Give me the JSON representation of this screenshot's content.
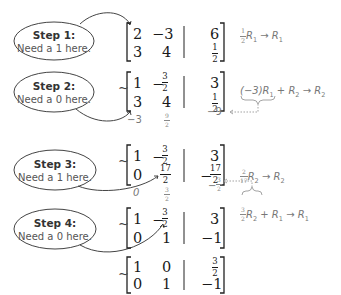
{
  "steps": [
    {
      "title": "Step 1:",
      "note": "Need a 1 here."
    },
    {
      "title": "Step 2:",
      "note": "Need a 0 here."
    },
    {
      "title": "Step 3:",
      "note": "Need a 1 here."
    },
    {
      "title": "Step 4:",
      "note": "Need a 0 here."
    }
  ],
  "tilde": "~",
  "matrices": [
    {
      "rows": [
        {
          "a": "2",
          "b": "−3",
          "c": "6"
        },
        {
          "a": "3",
          "b": "4",
          "c": {
            "num": "1",
            "den": "2"
          }
        }
      ],
      "operation": {
        "coef": {
          "num": "1",
          "den": "2"
        },
        "text": "R",
        "sub": "1",
        "arrow": "→",
        "target": "R",
        "target_sub": "1"
      }
    },
    {
      "rows": [
        {
          "a": "1",
          "b": {
            "sign": "−",
            "num": "3",
            "den": "2"
          },
          "c": "3"
        },
        {
          "a": "3",
          "b": "4",
          "c": {
            "num": "1",
            "den": "2"
          }
        }
      ],
      "operation": {
        "prefix": "(−3)R",
        "sub": "1",
        "plus": "+ R",
        "plus_sub": "2",
        "arrow": "→",
        "target": "R",
        "target_sub": "2"
      },
      "work": {
        "a": "−3",
        "b": {
          "num": "9",
          "den": "2"
        },
        "c": "−9"
      }
    },
    {
      "rows": [
        {
          "a": "1",
          "b": {
            "sign": "−",
            "num": "3",
            "den": "2"
          },
          "c": "3"
        },
        {
          "a": "0",
          "b": {
            "num": "17",
            "den": "2"
          },
          "c": {
            "sign": "−",
            "num": "17",
            "den": "2"
          }
        }
      ],
      "operation": {
        "coef": {
          "num": "2",
          "den": "17"
        },
        "text": "R",
        "sub": "2",
        "arrow": "→",
        "target": "R",
        "target_sub": "2"
      },
      "work": {
        "a": "0",
        "b": {
          "num": "3",
          "den": "2"
        },
        "c": {
          "sign": "−",
          "num": "3",
          "den": "2"
        }
      }
    },
    {
      "rows": [
        {
          "a": "1",
          "b": {
            "sign": "−",
            "num": "3",
            "den": "2"
          },
          "c": "3"
        },
        {
          "a": "0",
          "b": "1",
          "c": "−1"
        }
      ],
      "operation": {
        "coef": {
          "num": "3",
          "den": "2"
        },
        "text": "R",
        "sub": "2",
        "plus": "+ R",
        "plus_sub": "1",
        "arrow": "→",
        "target": "R",
        "target_sub": "1"
      }
    },
    {
      "rows": [
        {
          "a": "1",
          "b": "0",
          "c": {
            "num": "3",
            "den": "2"
          }
        },
        {
          "a": "0",
          "b": "1",
          "c": "−1"
        }
      ]
    }
  ]
}
